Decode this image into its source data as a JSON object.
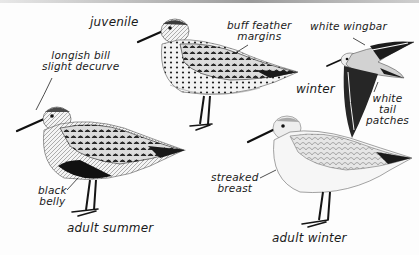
{
  "plate": {
    "subject": "Dunlin plumages",
    "colors": {
      "background": "#fdfdfd",
      "ink": "#1a1a1a",
      "dark_plumage": "#2a2a2a",
      "mid_plumage": "#8a8a8a",
      "light_plumage": "#d9d9d9"
    }
  },
  "figures": [
    {
      "id": "juvenile",
      "title": "juvenile"
    },
    {
      "id": "adult-summer",
      "title": "adult summer"
    },
    {
      "id": "adult-winter",
      "title": "adult winter"
    },
    {
      "id": "winter-flight",
      "title": "winter"
    }
  ],
  "annotations": {
    "longish_bill": {
      "line1": "longish bill",
      "line2": "slight decurve"
    },
    "buff_feather": {
      "line1": "buff feather",
      "line2": "margins"
    },
    "white_wingbar": {
      "line1": "white wingbar"
    },
    "white_tail": {
      "line1": "white",
      "line2": "tail",
      "line3": "patches"
    },
    "black_belly": {
      "line1": "black",
      "line2": "belly"
    },
    "streaked_breast": {
      "line1": "streaked",
      "line2": "breast"
    }
  }
}
